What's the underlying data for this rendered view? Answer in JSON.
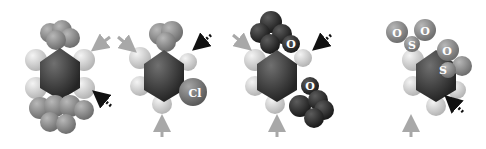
{
  "figure": {
    "type": "space-filling molecular models",
    "panels": [
      {
        "id": "p1",
        "description": "benzene ring with isopropyl/methyl groups above and below",
        "atom_labels": []
      },
      {
        "id": "p2",
        "description": "substituted benzene with chlorine",
        "atom_labels": [
          "Cl"
        ]
      },
      {
        "id": "p3",
        "description": "benzene with two methoxy-type groups",
        "atom_labels": [
          "O",
          "O"
        ]
      },
      {
        "id": "p4",
        "description": "benzene with sulfonyl groups",
        "atom_labels": [
          "O",
          "O",
          "S",
          "O",
          "S"
        ]
      }
    ],
    "arrows": {
      "solid_color": "#a8a8a8",
      "dotted_color": "#111111"
    },
    "colors": {
      "hydrogen": "#d9d9d9",
      "carbon_ring": "#3a3a3a",
      "methyl_gray": "#8a8a8a",
      "oxygen_dark": "#2b2b2b",
      "chlorine": "#7a7a7a",
      "sulfonyl": "#6a6a6a"
    }
  }
}
